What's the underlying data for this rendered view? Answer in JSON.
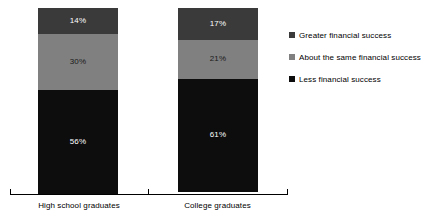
{
  "chart_data": {
    "type": "bar",
    "stacked": true,
    "title": "",
    "subtitle": "",
    "xlabel": "",
    "ylabel": "",
    "ylim": [
      0,
      100
    ],
    "grid": false,
    "legend_position": "right",
    "categories": [
      "High school graduates",
      "College graduates"
    ],
    "series": [
      {
        "name": "Greater financial success",
        "color": "#3a3a3a",
        "values": [
          14,
          17
        ],
        "labels": [
          "14%",
          "17%"
        ],
        "label_color": "#ffffff"
      },
      {
        "name": "About the same financial success",
        "color": "#808080",
        "values": [
          30,
          21
        ],
        "labels": [
          "30%",
          "21%"
        ],
        "label_color": "#1a1a1a"
      },
      {
        "name": "Less financial success",
        "color": "#0d0d0d",
        "values": [
          56,
          61
        ],
        "labels": [
          "56%",
          "61%"
        ],
        "label_color": "#ffffff"
      }
    ]
  },
  "axis": {
    "line_color": "#000000",
    "tick_count": 3
  },
  "legend": {
    "items": [
      {
        "label": "Greater financial success",
        "color": "#3a3a3a"
      },
      {
        "label": "About the same financial success",
        "color": "#808080"
      },
      {
        "label": "Less financial success",
        "color": "#0d0d0d"
      }
    ]
  }
}
